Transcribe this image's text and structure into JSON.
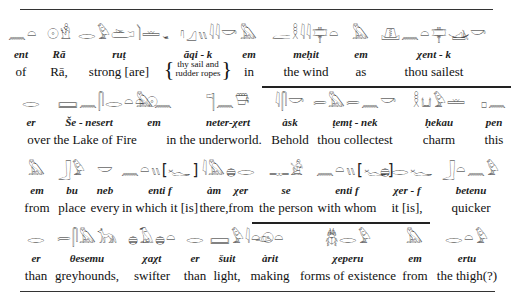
{
  "lines": [
    {
      "words": [
        {
          "glyph": "𓈖𓏏",
          "translit": "ent",
          "trans": "of",
          "x": 8,
          "w": 26
        },
        {
          "glyph": "𓇳𓁛",
          "translit": "Rā",
          "trans": "Rā,",
          "x": 44,
          "w": 30
        },
        {
          "glyph": "𓂋𓅱𓂧𓌙𓏛",
          "translit": "ruṭ",
          "trans": "strong [are]",
          "x": 78,
          "w": 82
        },
        {
          "glyph": "𓂝𓈎𓏭𓇋𓇋𓎡",
          "translit": "āqi - k",
          "trans": "thy sail and|rudder ropes",
          "x": 162,
          "w": 72,
          "brace": true
        },
        {
          "glyph": "𓅓",
          "translit": "em",
          "trans": "in",
          "x": 236,
          "w": 26
        },
        {
          "glyph": "𓐛𓎛𓇋𓇋𓊡𓏏",
          "translit": "meḥit",
          "trans": "the wind",
          "x": 266,
          "w": 80
        },
        {
          "glyph": "𓅓",
          "translit": "em",
          "trans": "as",
          "x": 348,
          "w": 26
        },
        {
          "glyph": "𓊚𓈖𓏏𓊡𓊛𓎡",
          "translit": "χent - k",
          "trans": "thou sailest",
          "x": 378,
          "w": 112
        }
      ]
    },
    {
      "words": [
        {
          "glyph": "𓂋",
          "translit": "er",
          "trans": "over the Lake of Fire",
          "x": 20,
          "w": 22,
          "transx": 24,
          "transw": 116
        },
        {
          "glyph": "𓈙𓈖𓋴𓂋𓏏𓏏𓇳",
          "translit": "Še - nesert",
          "trans": "",
          "x": 58,
          "w": 62
        },
        {
          "glyph": "𓅓𓈖",
          "translit": "em",
          "trans": "in the underworld.",
          "x": 132,
          "w": 44,
          "transx": 166,
          "transw": 96
        },
        {
          "glyph": "𓊹𓈖𓇥",
          "translit": "neter-χert",
          "trans": "",
          "x": 200,
          "w": 56
        },
        {
          "glyph": "𓇋𓋴𓎡",
          "translit": "àsk",
          "trans": "Behold",
          "x": 268,
          "w": 44
        },
        {
          "glyph": "𓍿𓅓𓍿𓈖𓎡",
          "translit": "ṭemṭ - nek",
          "trans": "thou collectest",
          "x": 310,
          "w": 90
        },
        {
          "glyph": "𓎛𓂓𓅱𓏛",
          "translit": "ḥekau",
          "trans": "charm",
          "x": 408,
          "w": 62
        },
        {
          "glyph": "𓊪𓈖",
          "translit": "pen",
          "trans": "this",
          "x": 478,
          "w": 32
        }
      ],
      "overbar": {
        "x": 262,
        "w": 249
      }
    },
    {
      "words": [
        {
          "glyph": "𓅓",
          "translit": "em",
          "trans": "from",
          "x": 22,
          "w": 30
        },
        {
          "glyph": "𓃀𓅱",
          "translit": "bu",
          "trans": "place",
          "x": 54,
          "w": 36
        },
        {
          "glyph": "𓎟",
          "translit": "neb",
          "trans": "every",
          "x": 90,
          "w": 30
        },
        {
          "glyph": "𓈖𓏏𓏭[𓆑]",
          "translit": "enti   f",
          "trans": "in which it [is]",
          "x": 120,
          "w": 80
        },
        {
          "glyph": "𓇋𓅓",
          "translit": "àm",
          "trans": "there,",
          "x": 196,
          "w": 36
        },
        {
          "glyph": "𓐍𓂋",
          "translit": "χer",
          "trans": "from",
          "x": 226,
          "w": 30
        },
        {
          "glyph": "𓊃𓀀",
          "translit": "se",
          "trans": "the person",
          "x": 256,
          "w": 60
        },
        {
          "glyph": "𓈖𓏏𓏭[𓆑]",
          "translit": "enti   f",
          "trans": "with whom",
          "x": 316,
          "w": 62
        },
        {
          "glyph": "𓐍𓂋𓆑",
          "translit": "χer - f",
          "trans": "it [is],",
          "x": 378,
          "w": 58
        },
        {
          "glyph": "𓃀𓏏𓈖𓅱",
          "translit": "betenu",
          "trans": "quicker",
          "x": 436,
          "w": 70
        }
      ]
    },
    {
      "words": [
        {
          "glyph": "𓂋",
          "translit": "er",
          "trans": "than",
          "x": 22,
          "w": 28
        },
        {
          "glyph": "𓍿𓋴𓅓𓃥",
          "translit": "θesemu",
          "trans": "greyhounds,",
          "x": 54,
          "w": 66
        },
        {
          "glyph": "𓐍𓄿𓐍𓏏",
          "translit": "χaχt",
          "trans": "swifter",
          "x": 124,
          "w": 56
        },
        {
          "glyph": "𓂋",
          "translit": "er",
          "trans": "than",
          "x": 180,
          "w": 30
        },
        {
          "glyph": "𓈙𓅱𓇋𓏏𓇳",
          "translit": "šuit",
          "trans": "light,",
          "x": 210,
          "w": 34
        },
        {
          "glyph": "𓁹𓏏",
          "translit": "àrit",
          "trans": "making",
          "x": 246,
          "w": 48
        },
        {
          "glyph": "𓆣𓂋𓅱",
          "translit": "χeperu",
          "trans": "forms of existence",
          "x": 298,
          "w": 100
        },
        {
          "glyph": "𓅓",
          "translit": "em",
          "trans": "from",
          "x": 398,
          "w": 34
        },
        {
          "glyph": "𓂋𓏏𓅱",
          "translit": "ertu",
          "trans": "the thigh(?)",
          "x": 434,
          "w": 66
        }
      ],
      "overbar": {
        "x": 252,
        "w": 178
      }
    }
  ],
  "rules": {
    "top": {
      "y": 9,
      "x": 20,
      "w": 473
    },
    "bottom": {
      "y": 291,
      "x": 20,
      "w": 475
    }
  }
}
